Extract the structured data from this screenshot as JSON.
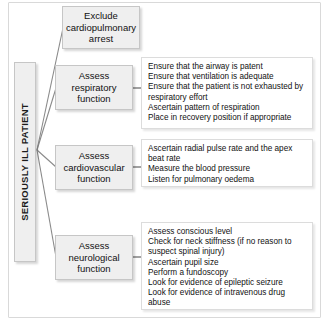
{
  "figure": {
    "spine_label": "SERIOUSLY ILL PATIENT",
    "stages": [
      {
        "title_line1": "Exclude",
        "title_line2": "cardiopulmonary",
        "title_line3": "arrest"
      },
      {
        "title_line1": "Assess",
        "title_line2": "respiratory",
        "title_line3": "function"
      },
      {
        "title_line1": "Assess",
        "title_line2": "cardiovascular",
        "title_line3": "function"
      },
      {
        "title_line1": "Assess",
        "title_line2": "neurological",
        "title_line3": "function"
      }
    ],
    "details": {
      "respiratory": [
        "Ensure that the airway is patent",
        "Ensure that ventilation is adequate",
        "Ensure that the patient is not exhausted by respiratory effort",
        "Ascertain pattern of respiration",
        "Place in recovery position if appropriate"
      ],
      "cardiovascular": [
        "Ascertain radial pulse rate and the apex beat rate",
        "Measure the blood pressure",
        "Listen for pulmonary oedema"
      ],
      "neurological": [
        "Assess conscious level",
        "Check for neck stiffness (if no reason to suspect spinal injury)",
        "Ascertain pupil size",
        "Perform a fundoscopy",
        "Look for evidence of epileptic seizure",
        "Look for evidence of intravenous drug abuse"
      ]
    }
  },
  "colors": {
    "box_fill": "#efefef",
    "box_border": "#c6c6c6",
    "panel_border": "#dcdcdc",
    "frame_border": "#d9d9d9",
    "connector": "#8a8a8a",
    "text": "#111111",
    "background": "#ffffff"
  }
}
